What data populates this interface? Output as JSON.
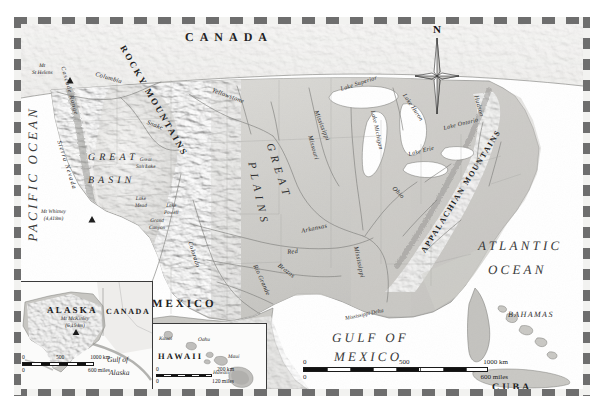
{
  "map": {
    "kind": "physical-relief-map",
    "region": "United States of America",
    "projection_note": "",
    "colors": {
      "ocean": "#ffffff",
      "land_low": "#c9c9c6",
      "land_high": "#f0efed",
      "border_dash_dark": "#6e6e6e",
      "border_dash_light": "#f2f2f0",
      "river": "#7b7b7b",
      "label": "#1a1a1a"
    }
  },
  "oceans": [
    {
      "name": "PACIFIC OCEAN",
      "orientation": "vertical"
    },
    {
      "name": "ATLANTIC OCEAN",
      "line1": "ATLANTIC",
      "line2": "OCEAN"
    },
    {
      "name": "GULF OF MEXICO",
      "line1": "GULF OF",
      "line2": "MEXICO"
    }
  ],
  "countries": [
    {
      "name": "CANADA"
    },
    {
      "name": "MEXICO"
    },
    {
      "name": "CUBA"
    },
    {
      "name": "BAHAMAS"
    }
  ],
  "physiographic_regions": [
    {
      "name": "GREAT BASIN",
      "line1": "GREAT",
      "line2": "BASIN"
    },
    {
      "name": "GREAT PLAINS",
      "word1": "GREAT",
      "word2": "PLAINS"
    }
  ],
  "mountain_ranges": [
    {
      "name": "ROCKY MOUNTAINS"
    },
    {
      "name": "APPALACHIAN MOUNTAINS"
    },
    {
      "name": "Sierra Nevada"
    },
    {
      "name": "Cascade Range"
    }
  ],
  "rivers": [
    {
      "name": "Columbia"
    },
    {
      "name": "Snake"
    },
    {
      "name": "Yellowstone"
    },
    {
      "name": "Missouri"
    },
    {
      "name": "Mississippi"
    },
    {
      "name": "Mississippi"
    },
    {
      "name": "Ohio"
    },
    {
      "name": "Arkansas"
    },
    {
      "name": "Red"
    },
    {
      "name": "Brazos"
    },
    {
      "name": "Rio Grande"
    },
    {
      "name": "Colorado"
    },
    {
      "name": "Hudson"
    }
  ],
  "lakes": [
    {
      "name": "Lake Superior"
    },
    {
      "name": "Lake Michigan"
    },
    {
      "name": "Lake Huron"
    },
    {
      "name": "Lake Erie"
    },
    {
      "name": "Lake Ontario"
    },
    {
      "name": "Great Salt Lake"
    },
    {
      "name": "Lake Mead"
    },
    {
      "name": "Lake Powell"
    }
  ],
  "peaks": [
    {
      "name": "Mt St Helens",
      "line1": "Mt",
      "line2": "St Helens"
    },
    {
      "name": "Mt Whitney",
      "line1": "Mt Whitney",
      "line2": "(4,418m)"
    }
  ],
  "features": [
    {
      "name": "Grand Canyon",
      "line1": "Grand",
      "line2": "Canyon"
    },
    {
      "name": "Mississippi Delta"
    }
  ],
  "compass": {
    "north_label": "N"
  },
  "main_scalebar": {
    "km": {
      "ticks": [
        "0",
        "500",
        "1000 km"
      ]
    },
    "miles": {
      "ticks": [
        "0",
        "600 miles"
      ]
    }
  },
  "insets": [
    {
      "id": "alaska",
      "title": "ALASKA",
      "neighbor": "CANADA",
      "water": {
        "line1": "Gulf of",
        "line2": "Alaska"
      },
      "peak": {
        "line1": "Mt McKinley",
        "line2": "(6,194m)"
      },
      "scalebar": {
        "km": {
          "ticks": [
            "0",
            "500",
            "1000 km"
          ]
        },
        "miles": {
          "ticks": [
            "0",
            "600 miles"
          ]
        }
      }
    },
    {
      "id": "hawaii",
      "title": "HAWAII",
      "islands": [
        "Kauai",
        "Oahu",
        "Maui",
        "Hawaii"
      ],
      "scalebar": {
        "km": {
          "ticks": [
            "0",
            "200 km"
          ]
        },
        "miles": {
          "ticks": [
            "0",
            "120 miles"
          ]
        }
      }
    }
  ]
}
